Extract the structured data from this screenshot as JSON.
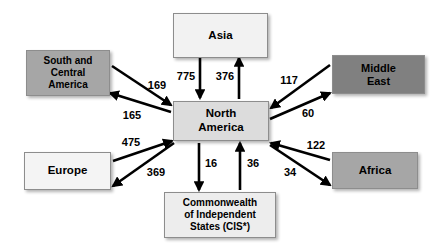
{
  "diagram": {
    "type": "flow-diagram",
    "background_color": "#ffffff",
    "arrow_color": "#000000",
    "border_color": "#8d8d8d"
  },
  "nodes": [
    {
      "id": "asia",
      "label": "Asia",
      "fill": "#f2f2f2",
      "x": 173,
      "y": 13,
      "w": 95,
      "h": 45,
      "font_size": 11.5
    },
    {
      "id": "south_central_america",
      "label": "South and\nCentral\nAmerica",
      "fill": "#a6a6a6",
      "x": 26,
      "y": 50,
      "w": 84,
      "h": 46,
      "font_size": 10
    },
    {
      "id": "middle_east",
      "label": "Middle\nEast",
      "fill": "#808080",
      "x": 332,
      "y": 55,
      "w": 93,
      "h": 39,
      "font_size": 11
    },
    {
      "id": "north_america",
      "label": "North\nAmerica",
      "fill": "#dcdcdc",
      "x": 173,
      "y": 101,
      "w": 96,
      "h": 40,
      "font_size": 11.5
    },
    {
      "id": "europe",
      "label": "Europe",
      "fill": "#f4f4f4",
      "x": 24,
      "y": 152,
      "w": 87,
      "h": 38,
      "font_size": 11.5
    },
    {
      "id": "africa",
      "label": "Africa",
      "fill": "#a6a6a6",
      "x": 332,
      "y": 152,
      "w": 86,
      "h": 37,
      "font_size": 11.5
    },
    {
      "id": "cis",
      "label": "Commonwealth\nof Independent\nStates (CIS*)",
      "fill": "#ededed",
      "x": 164,
      "y": 192,
      "w": 112,
      "h": 46,
      "font_size": 10
    }
  ],
  "flows": [
    {
      "id": "asia-to-north-america",
      "value": "775",
      "from": "asia",
      "to": "north_america",
      "x1": 200,
      "y1": 58,
      "x2": 200,
      "y2": 98,
      "label_x": 186,
      "label_y": 76,
      "font_size": 11
    },
    {
      "id": "north-america-to-asia",
      "value": "376",
      "from": "north_america",
      "to": "asia",
      "x1": 239,
      "y1": 99,
      "x2": 239,
      "y2": 58,
      "label_x": 225,
      "label_y": 76,
      "font_size": 11
    },
    {
      "id": "south-central-america-to-north-america",
      "value": "169",
      "from": "south_central_america",
      "to": "north_america",
      "x1": 112,
      "y1": 66,
      "x2": 171,
      "y2": 105,
      "label_x": 157,
      "label_y": 85,
      "font_size": 11
    },
    {
      "id": "north-america-to-south-central-america",
      "value": "165",
      "from": "north_america",
      "to": "south_central_america",
      "x1": 171,
      "y1": 112,
      "x2": 110,
      "y2": 93,
      "label_x": 132,
      "label_y": 115,
      "font_size": 11
    },
    {
      "id": "middle-east-to-north-america",
      "value": "117",
      "from": "middle_east",
      "to": "north_america",
      "x1": 330,
      "y1": 65,
      "x2": 271,
      "y2": 108,
      "label_x": 289,
      "label_y": 80,
      "font_size": 11
    },
    {
      "id": "north-america-to-middle-east",
      "value": "60",
      "from": "north_america",
      "to": "middle_east",
      "x1": 270,
      "y1": 119,
      "x2": 330,
      "y2": 93,
      "label_x": 308,
      "label_y": 113,
      "font_size": 11
    },
    {
      "id": "europe-to-north-america",
      "value": "475",
      "from": "europe",
      "to": "north_america",
      "x1": 113,
      "y1": 161,
      "x2": 172,
      "y2": 141,
      "label_x": 131,
      "label_y": 142,
      "font_size": 11
    },
    {
      "id": "north-america-to-europe",
      "value": "369",
      "from": "north_america",
      "to": "europe",
      "x1": 174,
      "y1": 143,
      "x2": 113,
      "y2": 186,
      "label_x": 156,
      "label_y": 172,
      "font_size": 11
    },
    {
      "id": "north-america-to-cis",
      "value": "16",
      "from": "north_america",
      "to": "cis",
      "x1": 199,
      "y1": 143,
      "x2": 199,
      "y2": 190,
      "label_x": 211,
      "label_y": 163,
      "font_size": 11
    },
    {
      "id": "cis-to-north-america",
      "value": "36",
      "from": "cis",
      "to": "north_america",
      "x1": 240,
      "y1": 190,
      "x2": 240,
      "y2": 143,
      "label_x": 253,
      "label_y": 163,
      "font_size": 11
    },
    {
      "id": "africa-to-north-america",
      "value": "122",
      "from": "africa",
      "to": "north_america",
      "x1": 330,
      "y1": 160,
      "x2": 271,
      "y2": 143,
      "label_x": 316,
      "label_y": 145,
      "font_size": 11
    },
    {
      "id": "north-america-to-africa",
      "value": "34",
      "from": "north_america",
      "to": "africa",
      "x1": 270,
      "y1": 145,
      "x2": 330,
      "y2": 185,
      "label_x": 290,
      "label_y": 172,
      "font_size": 11
    }
  ]
}
